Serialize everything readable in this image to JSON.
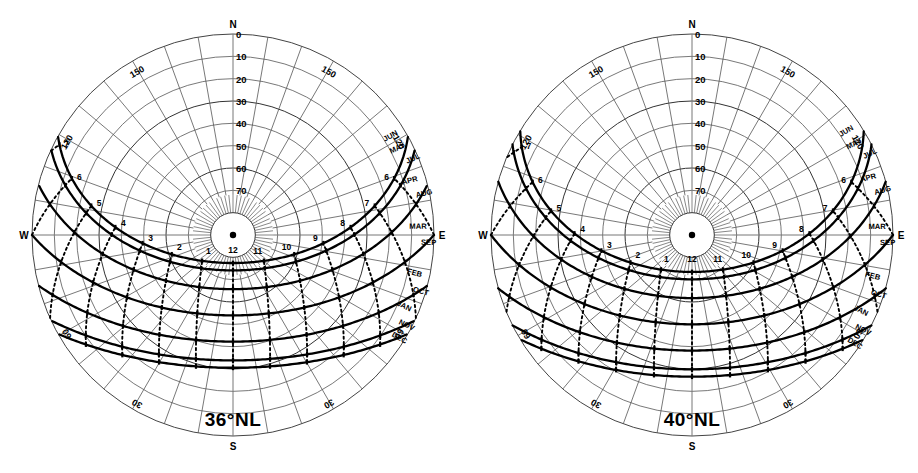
{
  "page": {
    "background": "#ffffff",
    "width": 918,
    "height": 473,
    "bottom_caption": ""
  },
  "charts": [
    {
      "id": "chart-36nl",
      "title": "36°NL",
      "latitude": 36,
      "cardinals": {
        "north": "N",
        "south": "S",
        "east": "E",
        "west": "W"
      },
      "altitude_labels": [
        "0",
        "10",
        "20",
        "30",
        "40",
        "50",
        "60",
        "70"
      ],
      "azimuth_labels": [
        "150",
        "120",
        "60",
        "30",
        "30",
        "60",
        "120",
        "150"
      ],
      "hour_labels": [
        "7",
        "6",
        "5",
        "4",
        "3",
        "2",
        "1",
        "12",
        "11",
        "10",
        "9",
        "8",
        "7",
        "6"
      ],
      "month_labels_east_upper": [
        "JUN",
        "MAY",
        "JUL",
        "APR",
        "AUG",
        "MAR",
        "SEP"
      ],
      "month_labels_east_lower": [
        "FEB",
        "OCT",
        "JAN",
        "NOV",
        "DEC"
      ],
      "accent": "#000000"
    },
    {
      "id": "chart-40nl",
      "title": "40°NL",
      "latitude": 40,
      "cardinals": {
        "north": "N",
        "south": "S",
        "east": "E",
        "west": "W"
      },
      "altitude_labels": [
        "0",
        "10",
        "20",
        "30",
        "40",
        "50",
        "60",
        "70"
      ],
      "azimuth_labels": [
        "150",
        "120",
        "60",
        "30",
        "30",
        "60",
        "120",
        "150"
      ],
      "hour_labels": [
        "7",
        "6",
        "5",
        "4",
        "3",
        "2",
        "1",
        "12",
        "11",
        "10",
        "9",
        "8",
        "7",
        "6"
      ],
      "month_labels_east_upper": [
        "JUN",
        "MAY",
        "JUL",
        "APR",
        "AUG",
        "MAR",
        "SEP"
      ],
      "month_labels_east_lower": [
        "FEB",
        "OCT",
        "JAN",
        "NOV",
        "DEC"
      ],
      "accent": "#000000"
    }
  ],
  "chart_data": [
    {
      "type": "line",
      "title": "36°NL",
      "subtitle": "Sun path diagram — equidistant polar projection, 36° North Latitude",
      "projection": "equidistant-polar",
      "xlabel": "Azimuth (degrees from North)",
      "ylabel": "Altitude (degrees above horizon)",
      "ylim": [
        0,
        90
      ],
      "grid": true,
      "legend": "none",
      "radial_ticks": [
        0,
        10,
        20,
        30,
        40,
        50,
        60,
        70,
        80,
        90
      ],
      "radial_tick_labels": [
        "0",
        "10",
        "20",
        "30",
        "40",
        "50",
        "60",
        "70",
        "",
        ""
      ],
      "angular_ticks": [
        0,
        30,
        60,
        90,
        120,
        150,
        180,
        210,
        240,
        270,
        300,
        330
      ],
      "angular_tick_labels": [
        "N",
        "150",
        "120",
        "E",
        "60",
        "30",
        "S",
        "30",
        "60",
        "W",
        "120",
        "150"
      ],
      "series": [
        {
          "name": "JUN",
          "declination": 23.45,
          "max_altitude": 77.45,
          "sunrise_azimuth": 60.8,
          "sunset_azimuth": 299.2,
          "day_length_hours": 14.5
        },
        {
          "name": "MAY / JUL",
          "declination": 20.15,
          "max_altitude": 74.15,
          "sunrise_azimuth": 64.8,
          "sunset_azimuth": 295.2,
          "day_length_hours": 14.1
        },
        {
          "name": "APR / AUG",
          "declination": 11.75,
          "max_altitude": 65.75,
          "sunrise_azimuth": 75.3,
          "sunset_azimuth": 284.7,
          "day_length_hours": 13.0
        },
        {
          "name": "MAR / SEP",
          "declination": 0.0,
          "max_altitude": 54.0,
          "sunrise_azimuth": 90.0,
          "sunset_azimuth": 270.0,
          "day_length_hours": 12.0
        },
        {
          "name": "FEB / OCT",
          "declination": -11.75,
          "max_altitude": 42.25,
          "sunrise_azimuth": 104.7,
          "sunset_azimuth": 255.3,
          "day_length_hours": 10.9
        },
        {
          "name": "JAN / NOV",
          "declination": -20.15,
          "max_altitude": 33.85,
          "sunrise_azimuth": 115.2,
          "sunset_azimuth": 244.8,
          "day_length_hours": 9.9
        },
        {
          "name": "DEC",
          "declination": -23.45,
          "max_altitude": 30.55,
          "sunrise_azimuth": 119.2,
          "sunset_azimuth": 240.8,
          "day_length_hours": 9.5
        }
      ],
      "hour_lines": [
        {
          "label": "12",
          "solar_hour": 12
        },
        {
          "label": "11",
          "solar_hour": 11
        },
        {
          "label": "10",
          "solar_hour": 10
        },
        {
          "label": "9",
          "solar_hour": 9
        },
        {
          "label": "8",
          "solar_hour": 8
        },
        {
          "label": "7",
          "solar_hour": 7
        },
        {
          "label": "6",
          "solar_hour": 6
        },
        {
          "label": "1",
          "solar_hour": 13
        },
        {
          "label": "2",
          "solar_hour": 14
        },
        {
          "label": "3",
          "solar_hour": 15
        },
        {
          "label": "4",
          "solar_hour": 16
        },
        {
          "label": "5",
          "solar_hour": 17
        },
        {
          "label": "6",
          "solar_hour": 18
        },
        {
          "label": "7",
          "solar_hour": 19
        }
      ]
    },
    {
      "type": "line",
      "title": "40°NL",
      "subtitle": "Sun path diagram — equidistant polar projection, 40° North Latitude",
      "projection": "equidistant-polar",
      "xlabel": "Azimuth (degrees from North)",
      "ylabel": "Altitude (degrees above horizon)",
      "ylim": [
        0,
        90
      ],
      "grid": true,
      "legend": "none",
      "radial_ticks": [
        0,
        10,
        20,
        30,
        40,
        50,
        60,
        70,
        80,
        90
      ],
      "radial_tick_labels": [
        "0",
        "10",
        "20",
        "30",
        "40",
        "50",
        "60",
        "70",
        "",
        ""
      ],
      "angular_ticks": [
        0,
        30,
        60,
        90,
        120,
        150,
        180,
        210,
        240,
        270,
        300,
        330
      ],
      "angular_tick_labels": [
        "N",
        "150",
        "120",
        "E",
        "60",
        "30",
        "S",
        "30",
        "60",
        "W",
        "120",
        "150"
      ],
      "series": [
        {
          "name": "JUN",
          "declination": 23.45,
          "max_altitude": 73.45,
          "sunrise_azimuth": 58.9,
          "sunset_azimuth": 301.1,
          "day_length_hours": 15.0
        },
        {
          "name": "MAY / JUL",
          "declination": 20.15,
          "max_altitude": 70.15,
          "sunrise_azimuth": 63.3,
          "sunset_azimuth": 296.7,
          "day_length_hours": 14.4
        },
        {
          "name": "APR / AUG",
          "declination": 11.75,
          "max_altitude": 61.75,
          "sunrise_azimuth": 74.6,
          "sunset_azimuth": 285.4,
          "day_length_hours": 13.2
        },
        {
          "name": "MAR / SEP",
          "declination": 0.0,
          "max_altitude": 50.0,
          "sunrise_azimuth": 90.0,
          "sunset_azimuth": 270.0,
          "day_length_hours": 12.0
        },
        {
          "name": "FEB / OCT",
          "declination": -11.75,
          "max_altitude": 38.25,
          "sunrise_azimuth": 105.4,
          "sunset_azimuth": 254.6,
          "day_length_hours": 10.8
        },
        {
          "name": "JAN / NOV",
          "declination": -20.15,
          "max_altitude": 29.85,
          "sunrise_azimuth": 116.7,
          "sunset_azimuth": 243.3,
          "day_length_hours": 9.6
        },
        {
          "name": "DEC",
          "declination": -23.45,
          "max_altitude": 26.55,
          "sunrise_azimuth": 121.1,
          "sunset_azimuth": 238.9,
          "day_length_hours": 9.0
        }
      ],
      "hour_lines": [
        {
          "label": "12",
          "solar_hour": 12
        },
        {
          "label": "11",
          "solar_hour": 11
        },
        {
          "label": "10",
          "solar_hour": 10
        },
        {
          "label": "9",
          "solar_hour": 9
        },
        {
          "label": "8",
          "solar_hour": 8
        },
        {
          "label": "7",
          "solar_hour": 7
        },
        {
          "label": "6",
          "solar_hour": 6
        },
        {
          "label": "1",
          "solar_hour": 13
        },
        {
          "label": "2",
          "solar_hour": 14
        },
        {
          "label": "3",
          "solar_hour": 15
        },
        {
          "label": "4",
          "solar_hour": 16
        },
        {
          "label": "5",
          "solar_hour": 17
        },
        {
          "label": "6",
          "solar_hour": 18
        },
        {
          "label": "7",
          "solar_hour": 19
        }
      ]
    }
  ]
}
